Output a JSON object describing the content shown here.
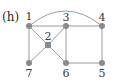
{
  "panel_label": "(h)",
  "colors": {
    "edge": "#9a9a9a",
    "node": "#8a8a8a",
    "label": "#3a3a3a"
  },
  "nodes": [
    {
      "id": "1",
      "label": "1",
      "x": 29,
      "y": 26,
      "lx": 29,
      "ly": 17
    },
    {
      "id": "2",
      "label": "2",
      "x": 48,
      "y": 45,
      "lx": 48,
      "ly": 37
    },
    {
      "id": "3",
      "label": "3",
      "x": 66,
      "y": 26,
      "lx": 66,
      "ly": 17
    },
    {
      "id": "4",
      "label": "4",
      "x": 102,
      "y": 26,
      "lx": 102,
      "ly": 17
    },
    {
      "id": "5",
      "label": "5",
      "x": 102,
      "y": 63,
      "lx": 102,
      "ly": 77
    },
    {
      "id": "6",
      "label": "6",
      "x": 66,
      "y": 63,
      "lx": 66,
      "ly": 77
    },
    {
      "id": "7",
      "label": "7",
      "x": 29,
      "y": 63,
      "lx": 29,
      "ly": 77
    }
  ],
  "edges": [
    {
      "from": "1",
      "to": "3",
      "type": "line"
    },
    {
      "from": "3",
      "to": "4",
      "type": "line"
    },
    {
      "from": "1",
      "to": "4",
      "type": "arc"
    },
    {
      "from": "1",
      "to": "7",
      "type": "line"
    },
    {
      "from": "3",
      "to": "6",
      "type": "line"
    },
    {
      "from": "4",
      "to": "5",
      "type": "line"
    },
    {
      "from": "6",
      "to": "5",
      "type": "line"
    },
    {
      "from": "1",
      "to": "2",
      "type": "line"
    },
    {
      "from": "2",
      "to": "6",
      "type": "line"
    },
    {
      "from": "3",
      "to": "2",
      "type": "line"
    },
    {
      "from": "2",
      "to": "7",
      "type": "line"
    }
  ]
}
